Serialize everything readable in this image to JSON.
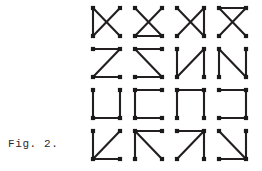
{
  "figure": {
    "caption": "Fig. 2.",
    "stroke_color": "#231f20",
    "node_color": "#1a1a1a",
    "background_color": "#ffffff",
    "grid": {
      "rows": 4,
      "columns": 4,
      "total_glyphs": 16
    },
    "vertices": {
      "top_left": [
        7,
        6
      ],
      "top_right": [
        34,
        6
      ],
      "bottom_left": [
        7,
        34
      ],
      "bottom_right": [
        34,
        34
      ]
    },
    "glyphs": [
      {
        "index": 1,
        "row": 1,
        "column": 1,
        "name": "x-with-left-edge",
        "description": "diagonal cross plus left vertical edge",
        "segments": [
          "top_left-bottom_right",
          "top_right-bottom_left",
          "top_left-bottom_left"
        ],
        "nodes": [
          "top_left",
          "top_right",
          "bottom_left",
          "bottom_right"
        ]
      },
      {
        "index": 2,
        "row": 1,
        "column": 2,
        "name": "x-with-bottom-edge",
        "description": "diagonal cross plus bottom horizontal edge",
        "segments": [
          "top_left-bottom_right",
          "top_right-bottom_left",
          "bottom_left-bottom_right"
        ],
        "nodes": [
          "top_left",
          "top_right",
          "bottom_left",
          "bottom_right"
        ]
      },
      {
        "index": 3,
        "row": 1,
        "column": 3,
        "name": "x-with-right-edge",
        "description": "diagonal cross plus right vertical edge",
        "segments": [
          "top_left-bottom_right",
          "top_right-bottom_left",
          "top_right-bottom_right"
        ],
        "nodes": [
          "top_left",
          "top_right",
          "bottom_left",
          "bottom_right"
        ]
      },
      {
        "index": 4,
        "row": 1,
        "column": 4,
        "name": "x-with-top-edge",
        "description": "diagonal cross plus top horizontal edge",
        "segments": [
          "top_left-bottom_right",
          "top_right-bottom_left",
          "top_left-top_right"
        ],
        "nodes": [
          "top_left",
          "top_right",
          "bottom_left",
          "bottom_right"
        ]
      },
      {
        "index": 5,
        "row": 2,
        "column": 1,
        "name": "letter-z",
        "description": "top edge, diagonal top-right to bottom-left, bottom edge",
        "segments": [
          "top_left-top_right",
          "top_right-bottom_left",
          "bottom_left-bottom_right"
        ],
        "nodes": [
          "top_left",
          "top_right",
          "bottom_left",
          "bottom_right"
        ]
      },
      {
        "index": 6,
        "row": 2,
        "column": 2,
        "name": "letter-z-mirrored",
        "description": "top edge, diagonal top-left to bottom-right, bottom edge",
        "segments": [
          "top_left-top_right",
          "top_left-bottom_right",
          "bottom_left-bottom_right"
        ],
        "nodes": [
          "top_left",
          "top_right",
          "bottom_left",
          "bottom_right"
        ]
      },
      {
        "index": 7,
        "row": 2,
        "column": 3,
        "name": "letter-n-mirrored",
        "description": "left vertical, diagonal bottom-left to top-right, right vertical",
        "segments": [
          "top_left-bottom_left",
          "bottom_left-top_right",
          "top_right-bottom_right"
        ],
        "nodes": [
          "top_left",
          "top_right",
          "bottom_left",
          "bottom_right"
        ]
      },
      {
        "index": 8,
        "row": 2,
        "column": 4,
        "name": "letter-n",
        "description": "left vertical, diagonal top-left to bottom-right, right vertical",
        "segments": [
          "top_left-bottom_left",
          "top_left-bottom_right",
          "top_right-bottom_right"
        ],
        "nodes": [
          "top_left",
          "top_right",
          "bottom_left",
          "bottom_right"
        ]
      },
      {
        "index": 9,
        "row": 3,
        "column": 1,
        "name": "letter-u",
        "description": "left vertical, bottom edge, right vertical",
        "segments": [
          "top_left-bottom_left",
          "bottom_left-bottom_right",
          "top_right-bottom_right"
        ],
        "nodes": [
          "top_left",
          "top_right",
          "bottom_left",
          "bottom_right"
        ]
      },
      {
        "index": 10,
        "row": 3,
        "column": 2,
        "name": "letter-c",
        "description": "top edge, left vertical, bottom edge",
        "segments": [
          "top_left-top_right",
          "top_left-bottom_left",
          "bottom_left-bottom_right"
        ],
        "nodes": [
          "top_left",
          "top_right",
          "bottom_left",
          "bottom_right"
        ]
      },
      {
        "index": 11,
        "row": 3,
        "column": 3,
        "name": "inverted-u",
        "description": "left vertical, top edge, right vertical",
        "segments": [
          "top_left-bottom_left",
          "top_left-top_right",
          "top_right-bottom_right"
        ],
        "nodes": [
          "top_left",
          "top_right",
          "bottom_left",
          "bottom_right"
        ]
      },
      {
        "index": 12,
        "row": 3,
        "column": 4,
        "name": "letter-c-mirrored",
        "description": "top edge, right vertical, bottom edge",
        "segments": [
          "top_left-top_right",
          "top_right-bottom_right",
          "bottom_left-bottom_right"
        ],
        "nodes": [
          "top_left",
          "top_right",
          "bottom_left",
          "bottom_right"
        ]
      },
      {
        "index": 13,
        "row": 4,
        "column": 1,
        "name": "arrow-corner-lower-left",
        "description": "left vertical, bottom edge, diagonal bottom-left to top-right",
        "segments": [
          "top_left-bottom_left",
          "bottom_left-bottom_right",
          "bottom_left-top_right"
        ],
        "nodes": [
          "top_left",
          "top_right",
          "bottom_left",
          "bottom_right"
        ]
      },
      {
        "index": 14,
        "row": 4,
        "column": 2,
        "name": "arrow-corner-upper-left",
        "description": "top edge, left vertical, diagonal top-left to bottom-right",
        "segments": [
          "top_left-top_right",
          "top_left-bottom_left",
          "top_left-bottom_right"
        ],
        "nodes": [
          "top_left",
          "top_right",
          "bottom_left",
          "bottom_right"
        ]
      },
      {
        "index": 15,
        "row": 4,
        "column": 3,
        "name": "arrow-corner-upper-right",
        "description": "top edge, right vertical, diagonal bottom-left to top-right",
        "segments": [
          "top_left-top_right",
          "top_right-bottom_right",
          "bottom_left-top_right"
        ],
        "nodes": [
          "top_left",
          "top_right",
          "bottom_left",
          "bottom_right"
        ]
      },
      {
        "index": 16,
        "row": 4,
        "column": 4,
        "name": "arrow-corner-lower-right",
        "description": "diagonal top-left to bottom-right, right vertical, bottom edge",
        "segments": [
          "top_left-bottom_right",
          "top_right-bottom_right",
          "bottom_left-bottom_right"
        ],
        "nodes": [
          "top_left",
          "top_right",
          "bottom_left",
          "bottom_right"
        ]
      }
    ]
  }
}
